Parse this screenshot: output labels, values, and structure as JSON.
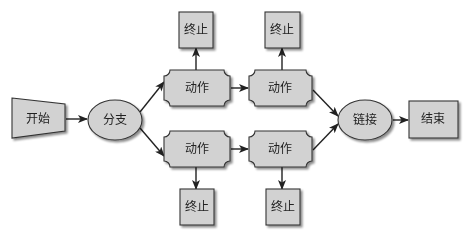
{
  "colors": {
    "shape_fill": "#d2d2d2",
    "shape_stroke": "#333333",
    "shadow": "#9a9a9a",
    "arrow": "#222222",
    "background": "#ffffff"
  },
  "nodes": {
    "start": {
      "label": "开始",
      "shape": "trapezoid"
    },
    "branch": {
      "label": "分支",
      "shape": "ellipse"
    },
    "action_top_1": {
      "label": "动作",
      "shape": "notched-rect"
    },
    "action_top_2": {
      "label": "动作",
      "shape": "notched-rect"
    },
    "action_bottom_1": {
      "label": "动作",
      "shape": "notched-rect"
    },
    "action_bottom_2": {
      "label": "动作",
      "shape": "notched-rect"
    },
    "terminate_top_1": {
      "label": "终止",
      "shape": "rect"
    },
    "terminate_top_2": {
      "label": "终止",
      "shape": "rect"
    },
    "terminate_bottom_1": {
      "label": "终止",
      "shape": "rect"
    },
    "terminate_bottom_2": {
      "label": "终止",
      "shape": "rect"
    },
    "join": {
      "label": "链接",
      "shape": "ellipse"
    },
    "end": {
      "label": "结束",
      "shape": "rect"
    }
  },
  "edges": [
    {
      "from": "start",
      "to": "branch"
    },
    {
      "from": "branch",
      "to": "action_top_1"
    },
    {
      "from": "branch",
      "to": "action_bottom_1"
    },
    {
      "from": "action_top_1",
      "to": "action_top_2"
    },
    {
      "from": "action_bottom_1",
      "to": "action_bottom_2"
    },
    {
      "from": "action_top_1",
      "to": "terminate_top_1"
    },
    {
      "from": "action_top_2",
      "to": "terminate_top_2"
    },
    {
      "from": "action_bottom_1",
      "to": "terminate_bottom_1"
    },
    {
      "from": "action_bottom_2",
      "to": "terminate_bottom_2"
    },
    {
      "from": "action_top_2",
      "to": "join"
    },
    {
      "from": "action_bottom_2",
      "to": "join"
    },
    {
      "from": "join",
      "to": "end"
    }
  ]
}
